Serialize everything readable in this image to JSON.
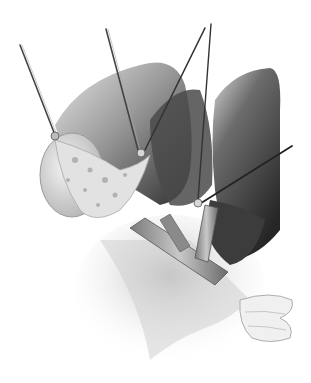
{
  "illustration": {
    "type": "grayscale surgical illustration",
    "caption": "",
    "background": "#ffffff",
    "palette": {
      "dark": "#3a3a3a",
      "mid": "#8a8a8a",
      "light": "#d8d8d8",
      "paper": "#ffffff"
    },
    "elements": [
      {
        "name": "left-liver-lobe",
        "description": "Large retracted lobe shaded dark to light gray"
      },
      {
        "name": "right-liver-lobe",
        "description": "Rounded lobe on the right side, dark shaded"
      },
      {
        "name": "gallbladder",
        "description": "Pale oval structure at left with mottled tissue"
      },
      {
        "name": "bile-duct",
        "description": "Y-shaped tubular duct running diagonally, banded gray"
      },
      {
        "name": "instrument-1",
        "description": "Thin rod from top-left down to gallbladder"
      },
      {
        "name": "instrument-2",
        "description": "Thin rod from upper-center down to tissue"
      },
      {
        "name": "instrument-3",
        "description": "Pair of rods from top-center crossing downward"
      },
      {
        "name": "instrument-4",
        "description": "Thin rod entering from the right toward duct junction"
      },
      {
        "name": "retractor-hand",
        "description": "Gloved fingers at lower right holding tissue"
      },
      {
        "name": "surrounding-tissue",
        "description": "Fibrous pale tissue at the bottom"
      }
    ]
  }
}
